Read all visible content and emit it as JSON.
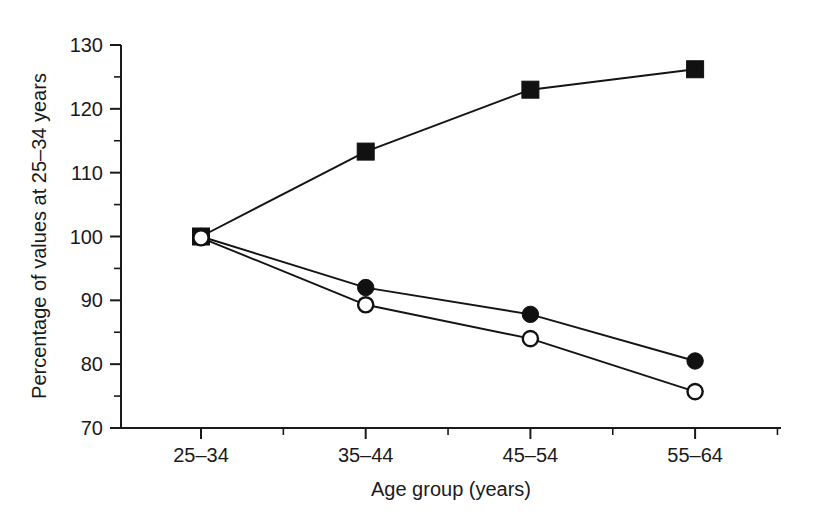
{
  "chart_data": {
    "type": "line",
    "title": "",
    "subtitle": "",
    "xlabel": "Age group (years)",
    "ylabel": "Percentage of values at 25–34 years",
    "categories": [
      "25–34",
      "35–44",
      "45–54",
      "55–64"
    ],
    "ylim": [
      70,
      130
    ],
    "ytick_labels": [
      "70",
      "80",
      "90",
      "100",
      "110",
      "120",
      "130"
    ],
    "ytick_values": [
      70,
      80,
      90,
      100,
      110,
      120,
      130
    ],
    "yminor_values": [
      75,
      85,
      95,
      105,
      115,
      125
    ],
    "grid": false,
    "legend": "none",
    "legend_position": "none",
    "series": [
      {
        "name": "filled-square-series",
        "marker": "filled-square",
        "color": "#111111",
        "values": [
          100.0,
          113.3,
          123.0,
          126.2
        ]
      },
      {
        "name": "filled-circle-series",
        "marker": "filled-circle",
        "color": "#111111",
        "values": [
          100.0,
          92.0,
          87.8,
          80.5
        ]
      },
      {
        "name": "open-circle-series",
        "marker": "open-circle",
        "color": "#111111",
        "values": [
          99.8,
          89.3,
          84.0,
          75.7
        ]
      }
    ],
    "annotations": []
  },
  "figure": {
    "background_color": "#ffffff",
    "axis_color": "#1a1a1a",
    "plot_area": {
      "left": 121,
      "right": 780,
      "top": 45,
      "bottom": 428
    }
  }
}
